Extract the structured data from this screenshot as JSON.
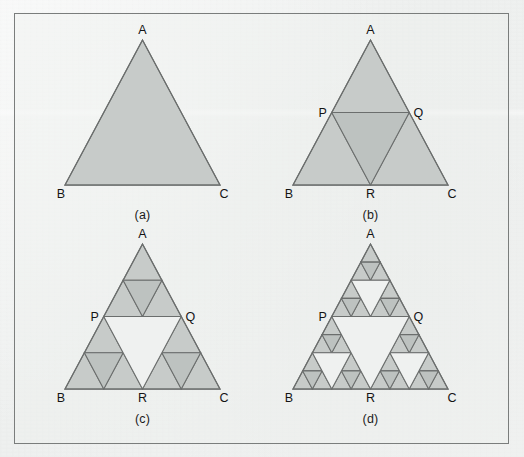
{
  "figure": {
    "kind": "sierpinski-triangle-progression",
    "frame": {
      "border_color": "#7a7d7c",
      "background_color": "#eff1f0"
    },
    "style": {
      "fill_color": "#c7cbc9",
      "hole_fill_color": "#bdc2c0",
      "stroke_color": "#6b6e6d",
      "background_color": "#eff1f0",
      "label_color": "#141414"
    },
    "panels": [
      {
        "id": "a",
        "caption": "(a)",
        "iteration": 0,
        "shaded_triangles": 1,
        "vertex_labels": [
          {
            "name": "A",
            "text": "A",
            "position": "apex"
          },
          {
            "name": "B",
            "text": "B",
            "position": "bottom-left"
          },
          {
            "name": "C",
            "text": "C",
            "position": "bottom-right"
          }
        ]
      },
      {
        "id": "b",
        "caption": "(b)",
        "iteration": 1,
        "shaded_triangles": 3,
        "vertex_labels": [
          {
            "name": "A",
            "text": "A",
            "position": "apex"
          },
          {
            "name": "B",
            "text": "B",
            "position": "bottom-left"
          },
          {
            "name": "C",
            "text": "C",
            "position": "bottom-right"
          },
          {
            "name": "P",
            "text": "P",
            "position": "midpoint-AB"
          },
          {
            "name": "Q",
            "text": "Q",
            "position": "midpoint-AC"
          },
          {
            "name": "R",
            "text": "R",
            "position": "midpoint-BC"
          }
        ]
      },
      {
        "id": "c",
        "caption": "(c)",
        "iteration": 2,
        "shaded_triangles": 9,
        "vertex_labels": [
          {
            "name": "A",
            "text": "A",
            "position": "apex"
          },
          {
            "name": "B",
            "text": "B",
            "position": "bottom-left"
          },
          {
            "name": "C",
            "text": "C",
            "position": "bottom-right"
          },
          {
            "name": "P",
            "text": "P",
            "position": "midpoint-AB"
          },
          {
            "name": "Q",
            "text": "Q",
            "position": "midpoint-AC"
          },
          {
            "name": "R",
            "text": "R",
            "position": "midpoint-BC"
          }
        ]
      },
      {
        "id": "d",
        "caption": "(d)",
        "iteration": 3,
        "shaded_triangles": 27,
        "vertex_labels": [
          {
            "name": "A",
            "text": "A",
            "position": "apex"
          },
          {
            "name": "B",
            "text": "B",
            "position": "bottom-left"
          },
          {
            "name": "C",
            "text": "C",
            "position": "bottom-right"
          },
          {
            "name": "P",
            "text": "P",
            "position": "midpoint-AB"
          },
          {
            "name": "Q",
            "text": "Q",
            "position": "midpoint-AC"
          },
          {
            "name": "R",
            "text": "R",
            "position": "midpoint-BC"
          }
        ]
      }
    ]
  }
}
